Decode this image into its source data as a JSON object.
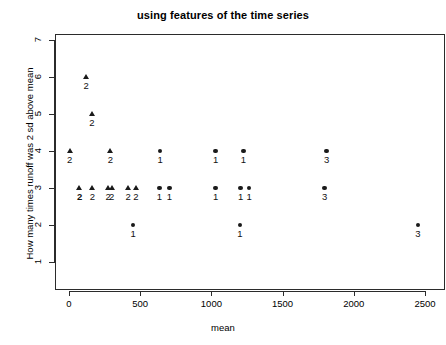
{
  "chart_data": {
    "type": "scatter",
    "title": "using features of the time series",
    "xlabel": "mean",
    "ylabel": "How many times runoff was 2 sd above mean",
    "xlim": [
      -120,
      2620
    ],
    "ylim": [
      0.62,
      7.25
    ],
    "xticks": [
      0,
      500,
      1000,
      1500,
      2000,
      2500
    ],
    "xtick_labels": [
      "0",
      "500",
      "1000",
      "1500",
      "2000",
      "2500"
    ],
    "yticks": [
      1,
      2,
      3,
      4,
      5,
      6,
      7
    ],
    "ytick_labels": [
      "1",
      "2",
      "3",
      "4",
      "5",
      "6",
      "7"
    ],
    "grid": false,
    "legend": "none",
    "marker_note": "cluster id printed below each marker; group 2 = triangle, groups 1 and 3 = filled circle",
    "points": [
      {
        "x": 120,
        "y": 6,
        "label": "2",
        "marker": "triangle",
        "bold": false
      },
      {
        "x": 160,
        "y": 5,
        "label": "2",
        "marker": "triangle",
        "bold": false
      },
      {
        "x": 5,
        "y": 4,
        "label": "2",
        "marker": "triangle",
        "bold": false
      },
      {
        "x": 290,
        "y": 4,
        "label": "2",
        "marker": "triangle",
        "bold": false
      },
      {
        "x": 640,
        "y": 4,
        "label": "1",
        "marker": "circle",
        "bold": false
      },
      {
        "x": 1030,
        "y": 4,
        "label": "1",
        "marker": "circle",
        "bold": false
      },
      {
        "x": 1225,
        "y": 4,
        "label": "1",
        "marker": "circle",
        "bold": false
      },
      {
        "x": 1810,
        "y": 4,
        "label": "3",
        "marker": "circle",
        "bold": false
      },
      {
        "x": 75,
        "y": 3,
        "label": "2",
        "marker": "triangle",
        "bold": true
      },
      {
        "x": 165,
        "y": 3,
        "label": "2",
        "marker": "triangle",
        "bold": false
      },
      {
        "x": 275,
        "y": 3,
        "label": "2",
        "marker": "triangle",
        "bold": false
      },
      {
        "x": 300,
        "y": 3,
        "label": "2",
        "marker": "triangle",
        "bold": false
      },
      {
        "x": 415,
        "y": 3,
        "label": "2",
        "marker": "triangle",
        "bold": false
      },
      {
        "x": 470,
        "y": 3,
        "label": "2",
        "marker": "triangle",
        "bold": false
      },
      {
        "x": 635,
        "y": 3,
        "label": "1",
        "marker": "circle",
        "bold": false
      },
      {
        "x": 705,
        "y": 3,
        "label": "1",
        "marker": "circle",
        "bold": false
      },
      {
        "x": 1030,
        "y": 3,
        "label": "1",
        "marker": "circle",
        "bold": false
      },
      {
        "x": 1205,
        "y": 3,
        "label": "1",
        "marker": "circle",
        "bold": false
      },
      {
        "x": 1265,
        "y": 3,
        "label": "1",
        "marker": "circle",
        "bold": false
      },
      {
        "x": 1795,
        "y": 3,
        "label": "3",
        "marker": "circle",
        "bold": false
      },
      {
        "x": 450,
        "y": 2,
        "label": "1",
        "marker": "circle",
        "bold": false
      },
      {
        "x": 1200,
        "y": 2,
        "label": "1",
        "marker": "circle",
        "bold": false
      },
      {
        "x": 2450,
        "y": 2,
        "label": "3",
        "marker": "circle",
        "bold": false
      }
    ]
  }
}
